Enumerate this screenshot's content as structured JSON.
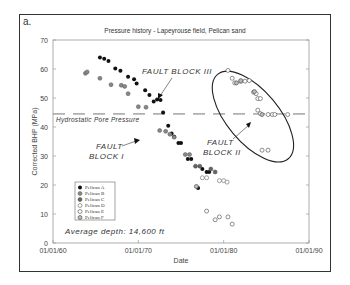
{
  "panel_label": "a.",
  "chart_data": {
    "type": "scatter",
    "title": "Pressure history - Lapeyrouse field, Pelican sand",
    "xlabel": "Date",
    "ylabel": "Corrected BHP (MPa)",
    "x_ticks": [
      "01/01/60",
      "01/01/70",
      "01/01/80",
      "01/01/90"
    ],
    "y_ticks": [
      0,
      10,
      20,
      30,
      40,
      50,
      60,
      70
    ],
    "xlim": [
      1960,
      1990
    ],
    "ylim": [
      0,
      70
    ],
    "grid": false,
    "legend_position": "lower-left inside",
    "reference_line": {
      "label": "Hydrostatic Pore Pressure",
      "y": 44.5,
      "style": "dashed"
    },
    "annotations": [
      {
        "text": "FAULT BLOCK III",
        "x": 1973.5,
        "y": 59
      },
      {
        "text": "FAULT BLOCK I",
        "x": 1966,
        "y": 33
      },
      {
        "text": "FAULT BLOCK II",
        "x": 1980.5,
        "y": 36
      },
      {
        "text": "Average depth: 14,600 ft",
        "x": 1963,
        "y": 6
      }
    ],
    "series": [
      {
        "name": "Pelican A",
        "marker": "filled-black",
        "points": [
          [
            1965.5,
            64
          ],
          [
            1966.0,
            63.5
          ],
          [
            1966.5,
            62.8
          ],
          [
            1967.3,
            60.2
          ],
          [
            1967.9,
            59.4
          ],
          [
            1968.8,
            57.3
          ],
          [
            1969.5,
            56.5
          ],
          [
            1969.8,
            55
          ],
          [
            1970.8,
            52.7
          ],
          [
            1971.3,
            51
          ],
          [
            1971.8,
            48.8
          ],
          [
            1972.2,
            49.5
          ],
          [
            1972.6,
            49.3
          ],
          [
            1972.9,
            45
          ],
          [
            1973.5,
            40.4
          ],
          [
            1973.9,
            37.8
          ],
          [
            1974.2,
            36.6
          ],
          [
            1974.7,
            34.5
          ],
          [
            1975.0,
            34.5
          ],
          [
            1975.8,
            29
          ],
          [
            1976.2,
            29
          ],
          [
            1977.5,
            25.5
          ],
          [
            1978.0,
            24.5
          ],
          [
            1978.3,
            24.5
          ],
          [
            1977.0,
            19
          ]
        ]
      },
      {
        "name": "Pelican B",
        "marker": "gray-filled",
        "points": [
          [
            1963.8,
            58.5
          ],
          [
            1964.0,
            59
          ],
          [
            1965.5,
            56.8
          ],
          [
            1966.8,
            54.6
          ],
          [
            1968.0,
            54.4
          ],
          [
            1968.4,
            54
          ],
          [
            1968.8,
            51.5
          ],
          [
            1970.0,
            47
          ],
          [
            1970.9,
            46.8
          ],
          [
            1972.5,
            38.8
          ],
          [
            1973.2,
            38.5
          ],
          [
            1973.7,
            37.5
          ],
          [
            1974.2,
            36.5
          ],
          [
            1975.5,
            30.5
          ],
          [
            1976.0,
            30.5
          ]
        ]
      },
      {
        "name": "Pelican C",
        "marker": "dark-gray-filled",
        "points": [
          [
            1976.7,
            26.5
          ],
          [
            1977.2,
            26.5
          ],
          [
            1978.5,
            25.5
          ],
          [
            1979.0,
            24.5
          ]
        ]
      },
      {
        "name": "Pelican D",
        "marker": "open-circle-gray",
        "points": [
          [
            1977.5,
            22.5
          ],
          [
            1978.0,
            22.5
          ],
          [
            1979.5,
            21.5
          ],
          [
            1980.0,
            21.5
          ],
          [
            1980.4,
            21
          ]
        ]
      },
      {
        "name": "Pelican E",
        "marker": "open-circle",
        "points": [
          [
            1980.5,
            59.5
          ],
          [
            1981.0,
            56.8
          ],
          [
            1981.3,
            55.2
          ],
          [
            1982.0,
            55.7
          ],
          [
            1982.5,
            55.8
          ],
          [
            1983.0,
            56
          ],
          [
            1983.5,
            52
          ],
          [
            1983.8,
            51.5
          ],
          [
            1984.0,
            49.8
          ],
          [
            1984.3,
            49.8
          ],
          [
            1984.0,
            45.8
          ],
          [
            1984.3,
            44.6
          ],
          [
            1985.2,
            44.3
          ],
          [
            1985.7,
            44.3
          ],
          [
            1986.0,
            44.3
          ],
          [
            1987.5,
            44.3
          ],
          [
            1984.5,
            32
          ],
          [
            1985.2,
            32
          ],
          [
            1978.0,
            11
          ],
          [
            1979.0,
            8
          ],
          [
            1979.5,
            9
          ],
          [
            1980.5,
            9
          ],
          [
            1981.0,
            6.5
          ]
        ]
      },
      {
        "name": "Pelican F",
        "marker": "gray-ring",
        "points": [
          [
            1981.5,
            55.2
          ],
          [
            1982.0,
            56
          ],
          [
            1983.6,
            52.2
          ],
          [
            1984.5,
            44.3
          ],
          [
            1976.8,
            19.5
          ]
        ]
      }
    ],
    "ellipse": {
      "center_x": 1983.5,
      "center_y": 47,
      "label": "FAULT BLOCK II outline"
    }
  },
  "legend": {
    "items": [
      {
        "label": "Pelican A",
        "marker": "filled-black"
      },
      {
        "label": "Pelican B",
        "marker": "gray-filled"
      },
      {
        "label": "Pelican C",
        "marker": "dark-gray-filled"
      },
      {
        "label": "Pelican D",
        "marker": "open-circle-gray"
      },
      {
        "label": "Pelican E",
        "marker": "open-circle"
      },
      {
        "label": "Pelican F",
        "marker": "gray-ring"
      }
    ]
  }
}
